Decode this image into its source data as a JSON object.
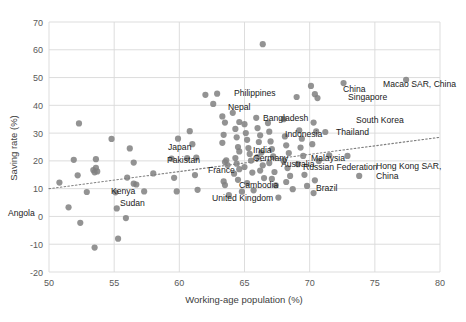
{
  "chart_data": {
    "type": "scatter",
    "title": "",
    "xlabel": "Working-age population (%)",
    "ylabel": "Saving rate (%)",
    "xlim": [
      50,
      80
    ],
    "ylim": [
      -20,
      70
    ],
    "xticks": [
      50,
      55,
      60,
      65,
      70,
      75,
      80
    ],
    "yticks": [
      -20,
      -10,
      0,
      10,
      20,
      30,
      40,
      50,
      60,
      70
    ],
    "grid": true,
    "legend": "none",
    "marker_color": "#808080",
    "marker_size": 5,
    "trendline": {
      "type": "linear-dotted",
      "x0": 50.0,
      "y0": 10.0,
      "x1": 80.0,
      "y1": 28.5,
      "color": "#808080"
    },
    "points": [
      {
        "x": 50.8,
        "y": 12.2,
        "label": ""
      },
      {
        "x": 51.5,
        "y": 3.3,
        "label": "Angola"
      },
      {
        "x": 51.9,
        "y": 20.4,
        "label": ""
      },
      {
        "x": 52.2,
        "y": 14.8,
        "label": ""
      },
      {
        "x": 52.3,
        "y": 33.5,
        "label": ""
      },
      {
        "x": 52.4,
        "y": -2.3,
        "label": ""
      },
      {
        "x": 52.9,
        "y": 8.8,
        "label": ""
      },
      {
        "x": 53.4,
        "y": 16.7,
        "label": ""
      },
      {
        "x": 53.5,
        "y": 15.9,
        "label": ""
      },
      {
        "x": 53.6,
        "y": 17.5,
        "label": ""
      },
      {
        "x": 53.7,
        "y": 16.2,
        "label": ""
      },
      {
        "x": 53.6,
        "y": 20.6,
        "label": ""
      },
      {
        "x": 53.5,
        "y": -11.2,
        "label": ""
      },
      {
        "x": 54.8,
        "y": 27.9,
        "label": ""
      },
      {
        "x": 55.1,
        "y": 8.7,
        "label": ""
      },
      {
        "x": 55.2,
        "y": 2.9,
        "label": ""
      },
      {
        "x": 55.3,
        "y": -8.0,
        "label": ""
      },
      {
        "x": 55.9,
        "y": -0.6,
        "label": ""
      },
      {
        "x": 56.0,
        "y": 14.0,
        "label": ""
      },
      {
        "x": 56.5,
        "y": 11.8,
        "label": ""
      },
      {
        "x": 56.7,
        "y": 11.5,
        "label": "Kenya"
      },
      {
        "x": 56.5,
        "y": 19.4,
        "label": ""
      },
      {
        "x": 56.2,
        "y": 24.5,
        "label": ""
      },
      {
        "x": 57.3,
        "y": 9.0,
        "label": "Sudan"
      },
      {
        "x": 58.0,
        "y": 15.5,
        "label": ""
      },
      {
        "x": 59.4,
        "y": 20.8,
        "label": ""
      },
      {
        "x": 59.6,
        "y": 13.9,
        "label": ""
      },
      {
        "x": 59.8,
        "y": 9.0,
        "label": ""
      },
      {
        "x": 59.9,
        "y": 28.0,
        "label": ""
      },
      {
        "x": 60.6,
        "y": 21.0,
        "label": ""
      },
      {
        "x": 60.8,
        "y": 30.7,
        "label": ""
      },
      {
        "x": 61.2,
        "y": 14.9,
        "label": ""
      },
      {
        "x": 61.4,
        "y": 9.6,
        "label": ""
      },
      {
        "x": 61.0,
        "y": 26.0,
        "label": "Japan"
      },
      {
        "x": 61.3,
        "y": 21.2,
        "label": "Pakistan"
      },
      {
        "x": 62.0,
        "y": 43.8,
        "label": ""
      },
      {
        "x": 62.6,
        "y": 40.5,
        "label": "Nepal"
      },
      {
        "x": 62.9,
        "y": 44.2,
        "label": "Philippines"
      },
      {
        "x": 63.3,
        "y": 36.0,
        "label": ""
      },
      {
        "x": 63.5,
        "y": 33.8,
        "label": ""
      },
      {
        "x": 63.4,
        "y": 29.4,
        "label": ""
      },
      {
        "x": 63.3,
        "y": 26.5,
        "label": ""
      },
      {
        "x": 63.6,
        "y": 20.2,
        "label": ""
      },
      {
        "x": 63.5,
        "y": 19.6,
        "label": ""
      },
      {
        "x": 63.7,
        "y": 18.5,
        "label": ""
      },
      {
        "x": 63.4,
        "y": 12.6,
        "label": ""
      },
      {
        "x": 63.5,
        "y": 11.3,
        "label": ""
      },
      {
        "x": 63.8,
        "y": 7.7,
        "label": ""
      },
      {
        "x": 64.1,
        "y": 37.3,
        "label": ""
      },
      {
        "x": 64.3,
        "y": 31.5,
        "label": "Bangladesh"
      },
      {
        "x": 64.6,
        "y": 34.0,
        "label": ""
      },
      {
        "x": 64.4,
        "y": 28.5,
        "label": ""
      },
      {
        "x": 64.5,
        "y": 25.0,
        "label": ""
      },
      {
        "x": 64.6,
        "y": 23.4,
        "label": ""
      },
      {
        "x": 64.3,
        "y": 21.0,
        "label": ""
      },
      {
        "x": 64.4,
        "y": 19.0,
        "label": "France"
      },
      {
        "x": 64.6,
        "y": 17.0,
        "label": ""
      },
      {
        "x": 64.2,
        "y": 15.4,
        "label": ""
      },
      {
        "x": 64.5,
        "y": 13.2,
        "label": "United Kingdom"
      },
      {
        "x": 64.8,
        "y": 8.9,
        "label": ""
      },
      {
        "x": 65.0,
        "y": 33.2,
        "label": ""
      },
      {
        "x": 65.1,
        "y": 30.0,
        "label": ""
      },
      {
        "x": 65.2,
        "y": 27.6,
        "label": ""
      },
      {
        "x": 65.3,
        "y": 24.6,
        "label": "India"
      },
      {
        "x": 65.4,
        "y": 22.5,
        "label": "Germany"
      },
      {
        "x": 65.5,
        "y": 20.1,
        "label": ""
      },
      {
        "x": 65.0,
        "y": 17.8,
        "label": ""
      },
      {
        "x": 65.6,
        "y": 15.8,
        "label": "Cambodia"
      },
      {
        "x": 65.2,
        "y": 12.0,
        "label": ""
      },
      {
        "x": 65.7,
        "y": 9.4,
        "label": ""
      },
      {
        "x": 65.9,
        "y": 35.5,
        "label": ""
      },
      {
        "x": 66.0,
        "y": 31.8,
        "label": ""
      },
      {
        "x": 66.2,
        "y": 29.2,
        "label": ""
      },
      {
        "x": 66.1,
        "y": 26.8,
        "label": ""
      },
      {
        "x": 66.3,
        "y": 23.0,
        "label": "Australia"
      },
      {
        "x": 66.0,
        "y": 21.4,
        "label": ""
      },
      {
        "x": 66.4,
        "y": 18.4,
        "label": ""
      },
      {
        "x": 66.2,
        "y": 16.5,
        "label": ""
      },
      {
        "x": 66.5,
        "y": 13.8,
        "label": ""
      },
      {
        "x": 66.4,
        "y": 62.0,
        "label": ""
      },
      {
        "x": 66.8,
        "y": 33.6,
        "label": ""
      },
      {
        "x": 66.9,
        "y": 30.5,
        "label": ""
      },
      {
        "x": 67.0,
        "y": 27.0,
        "label": "Indonesia"
      },
      {
        "x": 67.1,
        "y": 24.2,
        "label": ""
      },
      {
        "x": 67.2,
        "y": 21.6,
        "label": ""
      },
      {
        "x": 66.9,
        "y": 19.2,
        "label": ""
      },
      {
        "x": 67.3,
        "y": 16.0,
        "label": ""
      },
      {
        "x": 67.1,
        "y": 13.5,
        "label": ""
      },
      {
        "x": 67.4,
        "y": 11.2,
        "label": ""
      },
      {
        "x": 67.6,
        "y": 6.8,
        "label": ""
      },
      {
        "x": 68.0,
        "y": 35.0,
        "label": ""
      },
      {
        "x": 68.1,
        "y": 28.8,
        "label": ""
      },
      {
        "x": 68.2,
        "y": 25.6,
        "label": ""
      },
      {
        "x": 68.4,
        "y": 22.8,
        "label": "Malaysia"
      },
      {
        "x": 68.0,
        "y": 20.0,
        "label": ""
      },
      {
        "x": 68.3,
        "y": 17.4,
        "label": ""
      },
      {
        "x": 68.5,
        "y": 14.6,
        "label": ""
      },
      {
        "x": 68.2,
        "y": 12.4,
        "label": ""
      },
      {
        "x": 68.7,
        "y": 9.8,
        "label": ""
      },
      {
        "x": 69.0,
        "y": 43.0,
        "label": ""
      },
      {
        "x": 69.2,
        "y": 31.0,
        "label": ""
      },
      {
        "x": 69.4,
        "y": 28.0,
        "label": "Thailand"
      },
      {
        "x": 69.3,
        "y": 24.8,
        "label": ""
      },
      {
        "x": 69.5,
        "y": 21.8,
        "label": "Russian Federation"
      },
      {
        "x": 69.1,
        "y": 18.8,
        "label": ""
      },
      {
        "x": 69.6,
        "y": 15.0,
        "label": "Brazil"
      },
      {
        "x": 69.8,
        "y": 11.0,
        "label": ""
      },
      {
        "x": 70.1,
        "y": 47.0,
        "label": ""
      },
      {
        "x": 70.4,
        "y": 44.0,
        "label": "China"
      },
      {
        "x": 70.6,
        "y": 42.6,
        "label": "Singapore"
      },
      {
        "x": 70.3,
        "y": 33.8,
        "label": ""
      },
      {
        "x": 70.5,
        "y": 30.6,
        "label": ""
      },
      {
        "x": 70.2,
        "y": 26.0,
        "label": ""
      },
      {
        "x": 70.7,
        "y": 20.0,
        "label": ""
      },
      {
        "x": 70.4,
        "y": 13.0,
        "label": ""
      },
      {
        "x": 70.3,
        "y": 8.4,
        "label": ""
      },
      {
        "x": 71.2,
        "y": 30.4,
        "label": "South Korea"
      },
      {
        "x": 71.5,
        "y": 22.0,
        "label": ""
      },
      {
        "x": 72.6,
        "y": 48.0,
        "label": ""
      },
      {
        "x": 72.9,
        "y": 21.8,
        "label": "Hong Kong SAR, China"
      },
      {
        "x": 73.8,
        "y": 14.6,
        "label": ""
      },
      {
        "x": 77.4,
        "y": 49.2,
        "label": "Macao SAR, China"
      }
    ],
    "annotations": [
      {
        "text": "Angola",
        "x": 8,
        "y": 216,
        "anchor": "start"
      },
      {
        "text": "Kenya",
        "x": 111,
        "y": 194,
        "anchor": "start"
      },
      {
        "text": "Sudan",
        "x": 120,
        "y": 206,
        "anchor": "start"
      },
      {
        "text": "Japan",
        "x": 168,
        "y": 150,
        "anchor": "start"
      },
      {
        "text": "Pakistan",
        "x": 167,
        "y": 163,
        "anchor": "start"
      },
      {
        "text": "Nepal",
        "x": 228,
        "y": 110,
        "anchor": "start"
      },
      {
        "text": "Philippines",
        "x": 234,
        "y": 96,
        "anchor": "start"
      },
      {
        "text": "Bangladesh",
        "x": 263,
        "y": 121,
        "anchor": "start"
      },
      {
        "text": "France",
        "x": 208,
        "y": 173,
        "anchor": "start"
      },
      {
        "text": "United Kingdom",
        "x": 212,
        "y": 201,
        "anchor": "start"
      },
      {
        "text": "India",
        "x": 253,
        "y": 153,
        "anchor": "start"
      },
      {
        "text": "Germany",
        "x": 253,
        "y": 161,
        "anchor": "start"
      },
      {
        "text": "Cambodia",
        "x": 239,
        "y": 188,
        "anchor": "start"
      },
      {
        "text": "Australia",
        "x": 281,
        "y": 167,
        "anchor": "start"
      },
      {
        "text": "Indonesia",
        "x": 285,
        "y": 137,
        "anchor": "start"
      },
      {
        "text": "Malaysia",
        "x": 311,
        "y": 161,
        "anchor": "start"
      },
      {
        "text": "Thailand",
        "x": 336,
        "y": 135,
        "anchor": "start"
      },
      {
        "text": "Russian Federation",
        "x": 303,
        "y": 170,
        "anchor": "start"
      },
      {
        "text": "Brazil",
        "x": 316,
        "y": 191,
        "anchor": "start"
      },
      {
        "text": "South Korea",
        "x": 356,
        "y": 123,
        "anchor": "start"
      },
      {
        "text": "China",
        "x": 343,
        "y": 92,
        "anchor": "start"
      },
      {
        "text": "Singapore",
        "x": 348,
        "y": 100,
        "anchor": "start"
      },
      {
        "text": "Macao SAR, China",
        "x": 383,
        "y": 87,
        "anchor": "start"
      },
      {
        "text": "Hong Kong SAR,",
        "x": 376,
        "y": 169,
        "anchor": "start"
      },
      {
        "text": "China",
        "x": 376,
        "y": 179,
        "anchor": "start"
      }
    ]
  },
  "axes": {
    "x_title": "Working-age population (%)",
    "y_title": "Saving rate (%)",
    "x_tick_labels": [
      "50",
      "55",
      "60",
      "65",
      "70",
      "75",
      "80"
    ],
    "y_tick_labels": [
      "70",
      "60",
      "50",
      "40",
      "30",
      "20",
      "10",
      "0",
      "-10",
      "-20"
    ]
  },
  "colors": {
    "marker": "#808080",
    "grid": "#d9d9d9",
    "tick_text": "#595959",
    "label_text": "#1a1a1a",
    "background": "#ffffff"
  }
}
